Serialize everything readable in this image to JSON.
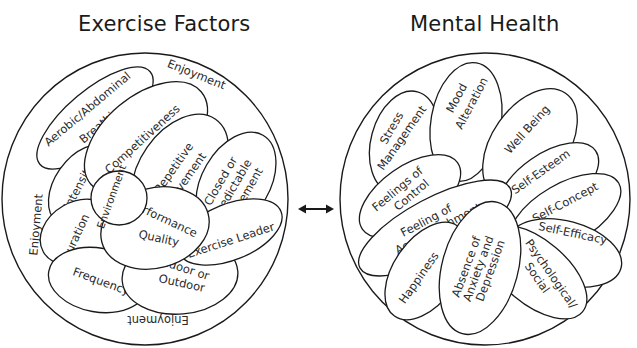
{
  "diagram": {
    "left": {
      "title": "Exercise Factors",
      "ring_labels": {
        "top": "Enjoyment",
        "left": "Enjoyment",
        "bottom": "Enjoyment"
      },
      "factors": {
        "aerobic_1": "Aerobic/Abdominal",
        "aerobic_2": "Breathing",
        "competitiveness": "Competitiveness",
        "repetitive_1": "Repetitive",
        "repetitive_2": "Movement",
        "closed_1": "Closed or",
        "closed_2": "Predictable",
        "closed_3": "Movement",
        "intensity": "Intensity",
        "environment": "Environment",
        "duration": "Duration",
        "performance_1": "Performance",
        "performance_2": "Quality",
        "exercise_leader": "Exercise Leader",
        "frequency": "Frequency",
        "indoor_1": "Indoor or",
        "indoor_2": "Outdoor"
      }
    },
    "connector": {
      "type": "double-headed-arrow",
      "color": "#1a1a1a"
    },
    "right": {
      "title": "Mental Health",
      "outcomes": {
        "stress_1": "Stress",
        "stress_2": "Management",
        "mood_1": "Mood",
        "mood_2": "Alteration",
        "well_being": "Well Being",
        "self_esteem": "Self-Esteem",
        "feelings_control_1": "Feelings of",
        "feelings_control_2": "Control",
        "self_concept": "Self-Concept",
        "accomplishment_1": "Feeling of",
        "accomplishment_2": "Accomplishment",
        "self_efficacy": "Self-Efficacy",
        "happiness": "Happiness",
        "absence_1": "Absence of",
        "absence_2": "Anxiety and",
        "absence_3": "Depression",
        "psych_1": "Psychological/",
        "psych_2": "Social"
      }
    },
    "colors": {
      "stroke": "#1a1a1a",
      "fill": "#ffffff",
      "text": "#2a2a2a"
    }
  }
}
